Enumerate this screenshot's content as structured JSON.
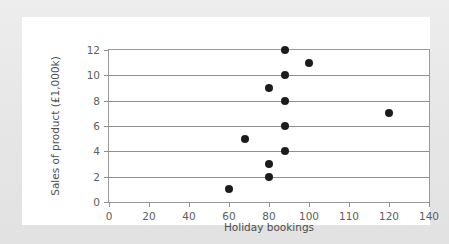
{
  "figure": {
    "background_color": "#ffffff",
    "page_color": "#e9e9e9",
    "point_color": "#1c1c1c",
    "axis_color": "#8f8f8f"
  },
  "chart_data": {
    "type": "scatter",
    "title": "",
    "xlabel": "Holiday bookings",
    "ylabel": "Sales of product (£1,000k)",
    "xlim": [
      0,
      140
    ],
    "ylim": [
      0,
      12
    ],
    "grid": true,
    "grid_axis": "y",
    "legend": null,
    "xticks": [
      0,
      20,
      40,
      60,
      80,
      100,
      110,
      120,
      140
    ],
    "xtick_labels": [
      "0",
      "20",
      "40",
      "60",
      "80",
      "100",
      "110",
      "120",
      "140"
    ],
    "yticks": [
      0,
      2,
      4,
      6,
      8,
      10,
      12
    ],
    "ytick_labels": [
      "0",
      "2",
      "4",
      "6",
      "8",
      "10",
      "12"
    ],
    "series": [
      {
        "name": "Sales vs holiday bookings",
        "marker": "filled-circle",
        "points": [
          {
            "x": 60,
            "y": 1
          },
          {
            "x": 68,
            "y": 5
          },
          {
            "x": 80,
            "y": 2
          },
          {
            "x": 80,
            "y": 3
          },
          {
            "x": 80,
            "y": 9
          },
          {
            "x": 88,
            "y": 4
          },
          {
            "x": 88,
            "y": 6
          },
          {
            "x": 88,
            "y": 8
          },
          {
            "x": 88,
            "y": 10
          },
          {
            "x": 88,
            "y": 12
          },
          {
            "x": 100,
            "y": 11
          },
          {
            "x": 120,
            "y": 7
          }
        ]
      }
    ]
  }
}
